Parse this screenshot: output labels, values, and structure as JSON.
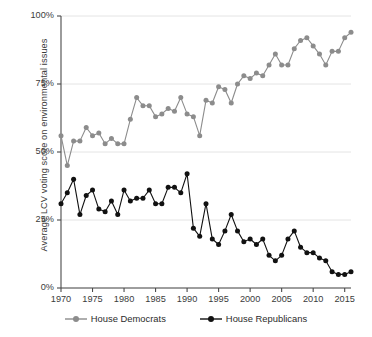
{
  "chart_data": {
    "type": "line",
    "title": "",
    "subtitle": "",
    "xlabel": "",
    "ylabel": "Average LCV voting score on environmental issues",
    "xlim": [
      1970,
      2016
    ],
    "ylim": [
      0,
      100
    ],
    "grid": true,
    "legend_position": "bottom",
    "y_ticks": [
      0,
      25,
      50,
      75,
      100
    ],
    "y_tick_labels": [
      "0%",
      "25%",
      "50%",
      "75%",
      "100%"
    ],
    "x_ticks": [
      1970,
      1975,
      1980,
      1985,
      1990,
      1995,
      2000,
      2005,
      2010,
      2015
    ],
    "x_tick_labels": [
      "1970",
      "1975",
      "1980",
      "1985",
      "1990",
      "1995",
      "2000",
      "2005",
      "2010",
      "2015"
    ],
    "x": [
      1970,
      1971,
      1972,
      1973,
      1974,
      1975,
      1976,
      1977,
      1978,
      1979,
      1980,
      1981,
      1982,
      1983,
      1984,
      1985,
      1986,
      1987,
      1988,
      1989,
      1990,
      1991,
      1992,
      1993,
      1994,
      1995,
      1996,
      1997,
      1998,
      1999,
      2000,
      2001,
      2002,
      2003,
      2004,
      2005,
      2006,
      2007,
      2008,
      2009,
      2010,
      2011,
      2012,
      2013,
      2014,
      2015,
      2016
    ],
    "series": [
      {
        "name": "House Democrats",
        "color": "#8c8c8c",
        "marker": "circle",
        "values": [
          56,
          45,
          54,
          54,
          59,
          56,
          57,
          53,
          55,
          53,
          53,
          62,
          70,
          67,
          67,
          63,
          64,
          66,
          65,
          70,
          64,
          63,
          56,
          69,
          68,
          74,
          73,
          68,
          75,
          78,
          77,
          79,
          78,
          82,
          86,
          82,
          82,
          88,
          91,
          92,
          89,
          86,
          82,
          87,
          87,
          92,
          94
        ]
      },
      {
        "name": "House Republicans",
        "color": "#111111",
        "marker": "circle",
        "values": [
          31,
          35,
          40,
          27,
          34,
          36,
          29,
          28,
          32,
          27,
          36,
          32,
          33,
          33,
          36,
          31,
          31,
          37,
          37,
          35,
          42,
          22,
          19,
          31,
          18,
          16,
          21,
          27,
          21,
          17,
          18,
          16,
          18,
          12,
          10,
          12,
          18,
          21,
          15,
          13,
          13,
          11,
          10,
          6,
          5,
          5,
          6
        ]
      }
    ],
    "legend": [
      {
        "label": "House Democrats",
        "color": "#8c8c8c"
      },
      {
        "label": "House Republicans",
        "color": "#111111"
      }
    ]
  },
  "styling": {
    "background": "#ffffff",
    "axis_color": "#4a4a4a",
    "grid_color": "#e4e4e4",
    "text_color": "#3b3b3b"
  }
}
